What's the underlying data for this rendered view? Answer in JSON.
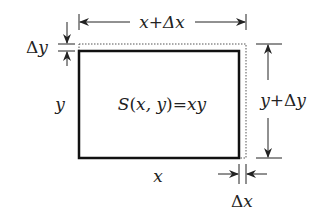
{
  "diagram": {
    "top_label": "x+Δx",
    "left_delta_label": "Δy",
    "left_label": "y",
    "center_label": "S(x, y)=xy",
    "right_label": "y+Δy",
    "bottom_label": "x",
    "bottom_delta_label": "Δx",
    "colors": {
      "line": "#111111",
      "text": "#222222",
      "dotted": "#555555",
      "background": "#ffffff"
    }
  }
}
